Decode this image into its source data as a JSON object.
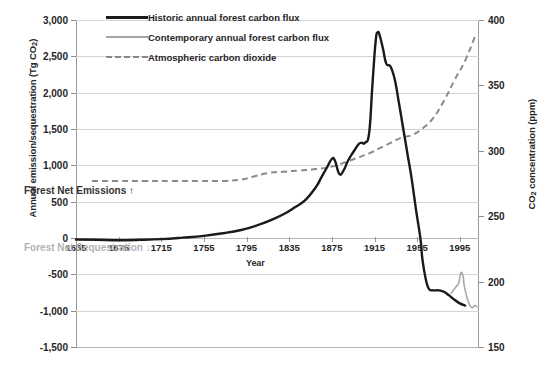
{
  "chart_data": {
    "type": "line",
    "title": "",
    "xlabel": "Year",
    "ylabel": "Annual emission/sequestration (Tg CO2)",
    "ylabel_right": "CO2 concentration (ppm)",
    "xlim": [
      1635,
      2013
    ],
    "ylim": [
      -1500,
      3000
    ],
    "ylim_right": [
      150,
      400
    ],
    "grid": true,
    "legend_position": "top-left-inside",
    "xticks": [
      1635,
      1675,
      1715,
      1755,
      1795,
      1835,
      1875,
      1915,
      1955,
      1995
    ],
    "yticks": [
      3000,
      2500,
      2000,
      1500,
      1000,
      500,
      0,
      -500,
      -1000,
      -1500
    ],
    "ytick_labels": [
      "3,000",
      "2,500",
      "2,000",
      "1,500",
      "1,000",
      "500",
      "0",
      "-500",
      "-1,000",
      "-1,500"
    ],
    "yticks_right": [
      400,
      350,
      300,
      250,
      200,
      150
    ],
    "ytick_labels_right": [
      "400",
      "350",
      "300",
      "250",
      "200",
      "150"
    ],
    "annotations": [
      {
        "text": "Forest Net Emissions ↑",
        "color": "#333333"
      },
      {
        "text": "Forest Net Sequestration ↓",
        "color": "#b3b3b3"
      }
    ],
    "series": [
      {
        "name": "Historic annual forest carbon flux",
        "axis": "left",
        "color": "#1a1a1a",
        "style": "solid-thick",
        "x": [
          1635,
          1655,
          1675,
          1695,
          1715,
          1735,
          1755,
          1775,
          1790,
          1800,
          1810,
          1820,
          1830,
          1840,
          1850,
          1860,
          1865,
          1870,
          1875,
          1878,
          1882,
          1886,
          1890,
          1895,
          1900,
          1903,
          1906,
          1910,
          1913,
          1916,
          1918,
          1920,
          1923,
          1926,
          1930,
          1934,
          1938,
          1942,
          1946,
          1950,
          1954,
          1958,
          1960,
          1963,
          1966,
          1970,
          1975,
          1980,
          1985,
          1990,
          1995,
          2000
        ],
        "y": [
          -20,
          -25,
          -30,
          -25,
          -15,
          5,
          30,
          70,
          110,
          150,
          200,
          260,
          330,
          420,
          520,
          700,
          830,
          960,
          1090,
          1060,
          880,
          930,
          1060,
          1180,
          1290,
          1310,
          1310,
          1450,
          2100,
          2700,
          2830,
          2780,
          2600,
          2400,
          2360,
          2180,
          1850,
          1500,
          1150,
          800,
          380,
          0,
          -300,
          -560,
          -700,
          -720,
          -720,
          -740,
          -790,
          -850,
          -900,
          -930
        ]
      },
      {
        "name": "Contemporary annual forest carbon flux",
        "axis": "left",
        "color": "#a8a8a8",
        "style": "solid-thin",
        "x": [
          1987,
          1990,
          1992,
          1994,
          1996,
          1998,
          1999,
          2001,
          2003,
          2005,
          2007,
          2009,
          2011
        ],
        "y": [
          -760,
          -700,
          -660,
          -620,
          -480,
          -520,
          -640,
          -780,
          -880,
          -940,
          -960,
          -930,
          -950
        ]
      },
      {
        "name": "Atmospheric carbon dioxide",
        "axis": "right",
        "color": "#8a8a8a",
        "style": "dashed",
        "x": [
          1650,
          1675,
          1700,
          1725,
          1750,
          1775,
          1790,
          1800,
          1815,
          1830,
          1845,
          1860,
          1875,
          1890,
          1900,
          1910,
          1920,
          1930,
          1940,
          1950,
          1960,
          1970,
          1980,
          1990,
          2000,
          2010
        ],
        "y": [
          277,
          277,
          277,
          277,
          277,
          277,
          278,
          280,
          283,
          284,
          285,
          286,
          288,
          292,
          295,
          298,
          302,
          306,
          310,
          312,
          317,
          325,
          338,
          354,
          369,
          389
        ]
      }
    ]
  },
  "legend": {
    "items": [
      {
        "label": "Historic annual forest carbon flux"
      },
      {
        "label": "Contemporary annual forest carbon flux"
      },
      {
        "label": "Atmospheric carbon dioxide"
      }
    ]
  },
  "axes": {
    "left_title_prefix": "Annual emission/sequestration (Tg CO",
    "left_title_sub": "2",
    "left_title_suffix": ")",
    "right_title_prefix": "CO",
    "right_title_sub": "2",
    "right_title_suffix": " concentration (ppm)",
    "x_title": "Year"
  }
}
